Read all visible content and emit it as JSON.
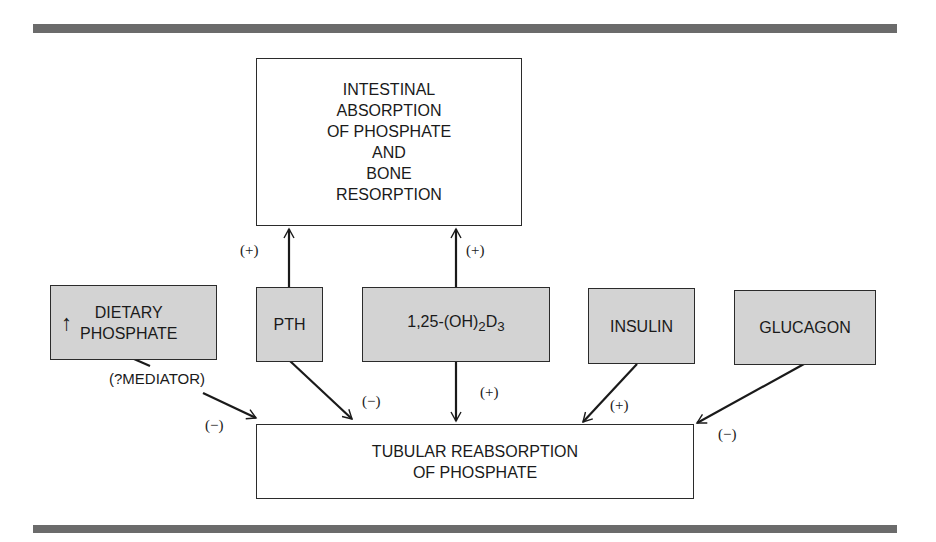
{
  "diagram": {
    "nodes": {
      "intestinal": {
        "text": "INTESTINAL\nABSORPTION\nOF PHOSPHATE\nAND\nBONE\nRESORPTION"
      },
      "dietary": {
        "arrow": "↑",
        "text": "DIETARY\nPHOSPHATE"
      },
      "pth": {
        "text": "PTH"
      },
      "vitd": {
        "base": "1,25-(OH)",
        "sub1": "2",
        "mid": "D",
        "sub2": "3"
      },
      "insulin": {
        "text": "INSULIN"
      },
      "glucagon": {
        "text": "GLUCAGON"
      },
      "tubular": {
        "text": "TUBULAR REABSORPTION\nOF PHOSPHATE"
      }
    },
    "edges": [
      {
        "from": "pth",
        "to": "intestinal",
        "sign": "(+)"
      },
      {
        "from": "vitd",
        "to": "intestinal",
        "sign": "(+)"
      },
      {
        "from": "dietary",
        "to": "tubular",
        "sign": "(−)",
        "note": "(?MEDIATOR)"
      },
      {
        "from": "pth",
        "to": "tubular",
        "sign": "(−)"
      },
      {
        "from": "vitd",
        "to": "tubular",
        "sign": "(+)"
      },
      {
        "from": "insulin",
        "to": "tubular",
        "sign": "(+)"
      },
      {
        "from": "glucagon",
        "to": "tubular",
        "sign": "(−)"
      }
    ]
  },
  "colors": {
    "rule": "#6b6b6b",
    "hormone_fill": "#d3d3d3",
    "line": "#1a1a1a"
  }
}
